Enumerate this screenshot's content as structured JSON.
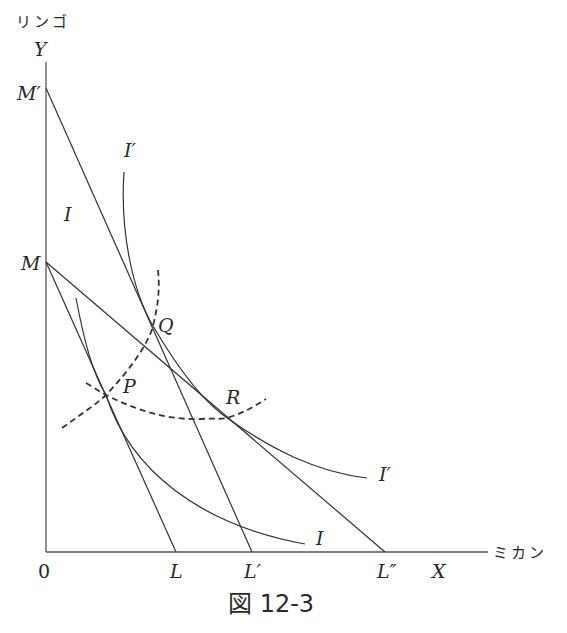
{
  "figure": {
    "caption": "図 12-3",
    "y_axis": {
      "name": "リンゴ",
      "label": "Y"
    },
    "x_axis": {
      "name": "ミカン",
      "label": "X"
    },
    "origin_label": "0",
    "intercepts": {
      "y": [
        {
          "label": "M′",
          "position": "upper"
        },
        {
          "label": "M",
          "position": "lower"
        }
      ],
      "x": [
        {
          "label": "L"
        },
        {
          "label": "L′"
        },
        {
          "label": "L″"
        }
      ]
    },
    "budget_lines": [
      {
        "from": "M",
        "to": "L"
      },
      {
        "from": "M′",
        "to": "L′"
      },
      {
        "from": "M",
        "to": "L″"
      }
    ],
    "indifference_curves": [
      {
        "label": "I",
        "tangent_point": "P"
      },
      {
        "label": "I′",
        "tangent_points": [
          "Q",
          "R"
        ]
      }
    ],
    "points": [
      "P",
      "Q",
      "R"
    ],
    "dashed_curves": [
      {
        "through": [
          "P",
          "Q"
        ],
        "description": "income-consumption curve"
      },
      {
        "through": [
          "P",
          "R"
        ],
        "description": "price-consumption curve"
      }
    ],
    "curve_labels": {
      "I_top": "I",
      "I_bottom": "I",
      "Iprime_top": "I′",
      "Iprime_right": "I′"
    }
  }
}
